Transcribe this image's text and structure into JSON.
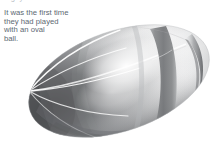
{
  "page": {
    "background_color": "#ffffff",
    "width": 216,
    "height": 148
  },
  "clipped_heading": {
    "text": "rugby ball and a round ball."
  },
  "paragraph": {
    "text_color": "#5c6872",
    "lines": [
      "It was the first time",
      "they had played",
      "with an oval",
      "ball."
    ]
  },
  "illustration": {
    "name": "oval-ball-3d-diagram",
    "description": "Shaded three-dimensional ellipsoid resembling an oval rugby ball, tilted with its long axis running from lower-left to upper-right, with a dark circumferential stripe near the right end and white meridian lines converging at the shaded left pole.",
    "colors": {
      "highlight": "#ffffff",
      "body_light": "#f4f4f5",
      "body_mid": "#c9cacb",
      "shadow_dark": "#6f7173",
      "shadow_darkest": "#4e5052",
      "stripe_dark": "#7e8082",
      "meridian_line": "#ffffff",
      "outline": "#b9babc"
    },
    "features": [
      "left-pole-shading",
      "meridian-lines",
      "equator-line",
      "dark-stripe-band",
      "right-tip-crescent",
      "bottom-edge-shading"
    ]
  }
}
